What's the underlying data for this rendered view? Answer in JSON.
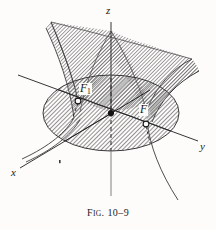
{
  "figure": {
    "caption_prefix_cap": "F",
    "caption_prefix_small": "IG",
    "caption_period": ".",
    "caption_number": "10–9",
    "caption_full": "FIG. 10–9",
    "background_color": "#fdfcfb",
    "ink_color": "#1c1c1c",
    "hatch_color": "#6f6f6f",
    "surface_fill": "#b4b4b4",
    "ellipse_fill": "#a9a9a9"
  },
  "axes": [
    {
      "name": "x-axis",
      "label": "x",
      "label_x": 14,
      "label_y": 173
    },
    {
      "name": "y-axis",
      "label": "y",
      "label_x": 201,
      "label_y": 147
    },
    {
      "name": "z-axis",
      "label": "z",
      "label_x": 107,
      "label_y": 12
    }
  ],
  "points": [
    {
      "name": "focus-1",
      "label": "F",
      "subscript": "1",
      "box_x": 80,
      "box_y": 86,
      "marker_x": 78,
      "marker_y": 101,
      "marker_style": "open-circle"
    },
    {
      "name": "focus-2",
      "label": "F",
      "subscript": "",
      "box_x": 138,
      "box_y": 105,
      "marker_x": 145,
      "marker_y": 124,
      "marker_style": "open-circle"
    },
    {
      "name": "origin",
      "label": "",
      "subscript": "",
      "marker_x": 111,
      "marker_y": 113,
      "marker_style": "filled-dot"
    }
  ],
  "surface": {
    "name": "hyperboloid-of-one-sheet",
    "hatched": true,
    "hatch_angle_deg": 45
  }
}
